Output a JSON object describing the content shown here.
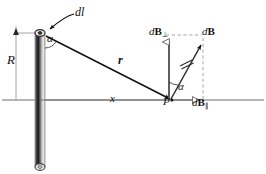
{
  "figure": {
    "caption_labels": {
      "dl": "dl",
      "alpha_rod": "α",
      "R": "R",
      "r": "r",
      "x": "x",
      "P": "P",
      "alpha_point": "α",
      "dB_perp_main": "d",
      "dB_perp_B": "B",
      "dB_perp_sub": "⊥",
      "dB_main": "d",
      "dB_B": "B",
      "dB_par_main": "d",
      "dB_par_B": "B",
      "dB_par_sub": "∥"
    },
    "colors": {
      "ink": "#111111",
      "axis": "#6f6f6f",
      "dashed": "#9a9a9a",
      "rod_dark": "#2b2b2b",
      "rod_light": "#d8d8d8",
      "rod_mid": "#8c8c8c",
      "background": "#ffffff"
    },
    "geometry": {
      "rod_top_x": 40,
      "rod_top_y": 33,
      "rod_bottom_y": 168,
      "axis_y": 100,
      "axis_x_start": 2,
      "axis_x_end": 264,
      "point_P_x": 173,
      "point_P_y": 100,
      "dB_perp_tip_y": 37,
      "dB_tip_x": 203,
      "dB_tip_y": 41,
      "dB_par_tip_x": 203
    }
  }
}
